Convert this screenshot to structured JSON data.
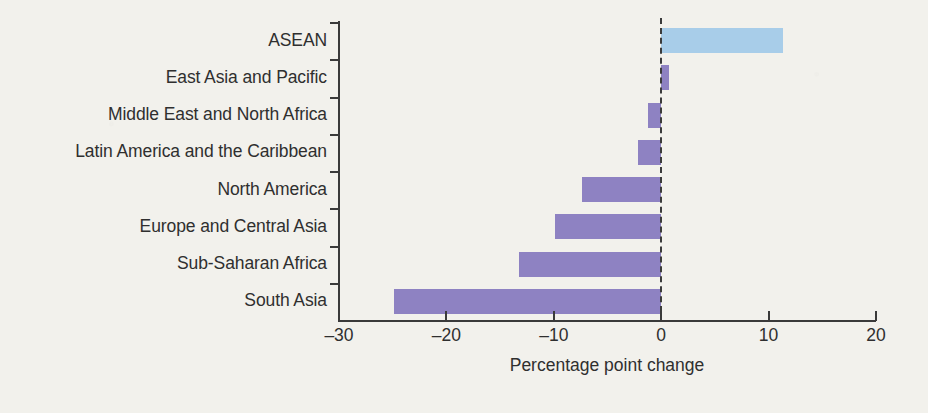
{
  "chart_data": {
    "type": "bar",
    "orientation": "horizontal",
    "title": "",
    "subtitle": "",
    "xlabel": "Percentage point change",
    "ylabel": "",
    "xlim": [
      -30,
      20
    ],
    "xticks": [
      -30,
      -20,
      -10,
      0,
      20
    ],
    "xtick_labels": [
      "–30",
      "–20",
      "–10",
      "0",
      "10",
      "20"
    ],
    "xtick_values": [
      -30,
      -20,
      -10,
      0,
      10,
      20
    ],
    "grid": false,
    "legend": "none",
    "zero_reference_line": true,
    "categories": [
      "ASEAN",
      "East Asia and Pacific",
      "Middle East and North Africa",
      "Latin America and the Caribbean",
      "North America",
      "Europe and Central Asia",
      "Sub-Saharan Africa",
      "South Asia"
    ],
    "values": [
      11.3,
      0.7,
      -1.2,
      -2.2,
      -7.4,
      -9.9,
      -13.2,
      -24.9
    ],
    "bar_colors": [
      "#a8cde9",
      "#8e82c2",
      "#8e82c2",
      "#8e82c2",
      "#8e82c2",
      "#8e82c2",
      "#8e82c2",
      "#8e82c2"
    ],
    "colors": {
      "highlight": "#a8cde9",
      "default": "#8e82c2",
      "axis": "#3a3a3a",
      "text": "#2f2f2f",
      "background": "#f2f1ec"
    }
  }
}
